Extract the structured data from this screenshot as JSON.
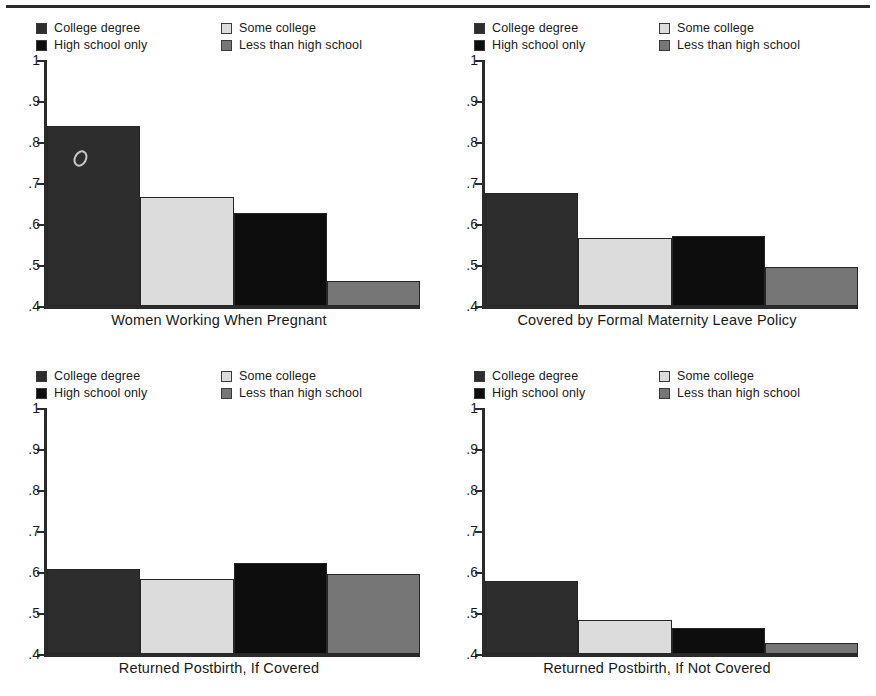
{
  "figure": {
    "top_rule": true,
    "legend": {
      "entries": [
        {
          "label": "College degree",
          "color": "#2d2d2d",
          "column": 1,
          "row": 1
        },
        {
          "label": "High school only",
          "color": "#0d0d0d",
          "column": 1,
          "row": 2
        },
        {
          "label": "Some college",
          "color": "#dcdcdc",
          "column": 2,
          "row": 1
        },
        {
          "label": "Less than high school",
          "color": "#767676",
          "column": 2,
          "row": 2
        }
      ]
    },
    "axis": {
      "ylim": [
        0.4,
        1.0
      ],
      "yticks": [
        "1",
        ".9",
        ".8",
        ".7",
        ".6",
        ".5",
        ".4"
      ],
      "ytick_values": [
        1.0,
        0.9,
        0.8,
        0.7,
        0.6,
        0.5,
        0.4
      ],
      "grid": false
    },
    "artifact": {
      "name": "scan-blemish",
      "panel": "top-left",
      "x": 74,
      "y": 150
    }
  },
  "chart_data": [
    {
      "type": "bar",
      "panel": "top-left",
      "title": "Women Working When Pregnant",
      "xlabel": "Women Working When Pregnant",
      "ylabel": "",
      "ylim": [
        0.4,
        1.0
      ],
      "yticks": [
        0.4,
        0.5,
        0.6,
        0.7,
        0.8,
        0.9,
        1.0
      ],
      "categories": [
        "College degree",
        "Some college",
        "High school only",
        "Less than high school"
      ],
      "values": [
        0.84,
        0.666,
        0.628,
        0.46
      ],
      "colors": [
        "#2d2d2d",
        "#dcdcdc",
        "#0d0d0d",
        "#767676"
      ]
    },
    {
      "type": "bar",
      "panel": "top-right",
      "title": "Covered by Formal Maternity Leave Policy",
      "xlabel": "Covered by Formal Maternity Leave Policy",
      "ylabel": "",
      "ylim": [
        0.4,
        1.0
      ],
      "yticks": [
        0.4,
        0.5,
        0.6,
        0.7,
        0.8,
        0.9,
        1.0
      ],
      "categories": [
        "College degree",
        "Some college",
        "High school only",
        "Less than high school"
      ],
      "values": [
        0.675,
        0.565,
        0.57,
        0.496
      ],
      "colors": [
        "#2d2d2d",
        "#dcdcdc",
        "#0d0d0d",
        "#767676"
      ]
    },
    {
      "type": "bar",
      "panel": "bottom-left",
      "title": "Returned Postbirth, If Covered",
      "xlabel": "Returned Postbirth, If Covered",
      "ylabel": "",
      "ylim": [
        0.4,
        1.0
      ],
      "yticks": [
        0.4,
        0.5,
        0.6,
        0.7,
        0.8,
        0.9,
        1.0
      ],
      "categories": [
        "College degree",
        "Some college",
        "High school only",
        "Less than high school"
      ],
      "values": [
        0.608,
        0.583,
        0.623,
        0.595
      ],
      "colors": [
        "#2d2d2d",
        "#dcdcdc",
        "#0d0d0d",
        "#767676"
      ]
    },
    {
      "type": "bar",
      "panel": "bottom-right",
      "title": "Returned Postbirth, If Not Covered",
      "xlabel": "Returned Postbirth, If Not Covered",
      "ylabel": "",
      "ylim": [
        0.4,
        1.0
      ],
      "yticks": [
        0.4,
        0.5,
        0.6,
        0.7,
        0.8,
        0.9,
        1.0
      ],
      "categories": [
        "College degree",
        "Some college",
        "High school only",
        "Less than high school"
      ],
      "values": [
        0.578,
        0.482,
        0.464,
        0.428
      ],
      "colors": [
        "#2d2d2d",
        "#dcdcdc",
        "#0d0d0d",
        "#767676"
      ]
    }
  ]
}
